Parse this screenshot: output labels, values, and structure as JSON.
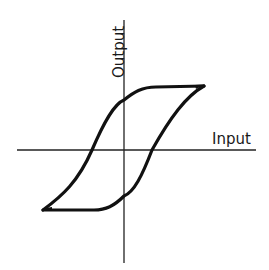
{
  "diagram": {
    "type": "hysteresis-loop",
    "x_axis": {
      "label": "Input"
    },
    "y_axis": {
      "label": "Output"
    },
    "colors": {
      "curve": "#111111",
      "axes": "#222222",
      "background": "#ffffff"
    }
  }
}
